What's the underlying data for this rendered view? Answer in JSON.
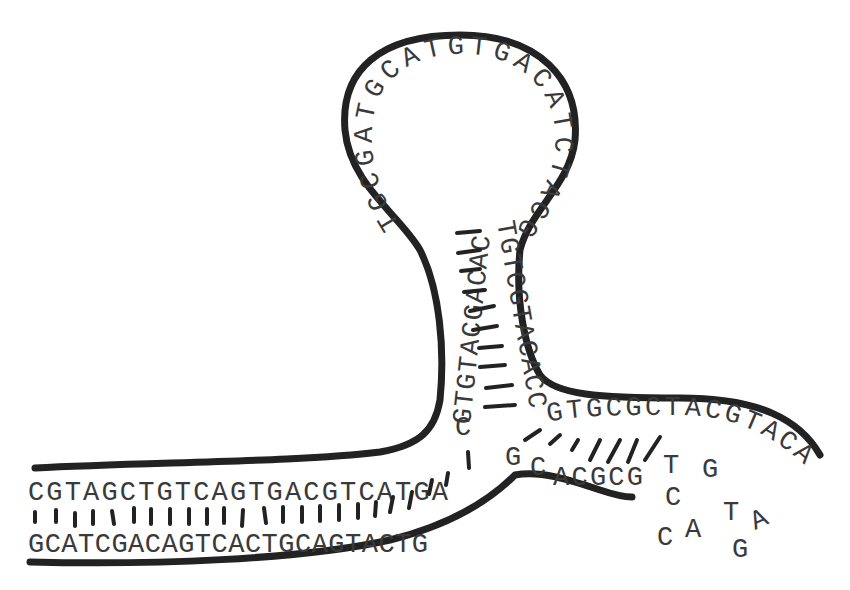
{
  "diagram": {
    "type": "DNA hairpin / stem-loop structure",
    "left_duplex": {
      "top_strand": "CGTAGCTGTCAGTGACGTCATGA",
      "bottom_strand": "GCATCGACAGTCACTGCAGTACTG"
    },
    "junction": {
      "top_letter": "C",
      "bottom_letters": [
        "G",
        "C"
      ]
    },
    "stem": {
      "left_strand_upward": "GTGTACGACAC",
      "right_strand_downward": "TGTCGTACACC"
    },
    "loop": "TGCGATGCATGTGACATCTACGTA",
    "right_duplex": {
      "top_strand": "GTGCGCTACGTACA",
      "bottom_strand": "ACGCG"
    },
    "free_bases": [
      "T",
      "C",
      "C",
      "A",
      "G",
      "T",
      "A",
      "G"
    ]
  }
}
